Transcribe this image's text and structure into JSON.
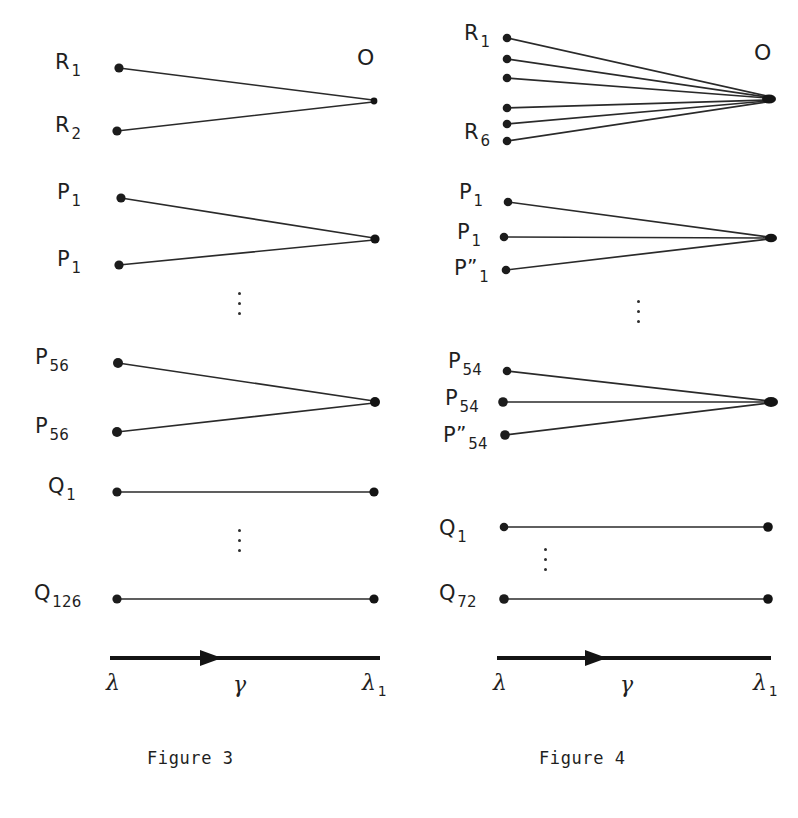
{
  "document": {
    "type": "scientific-figure-plate",
    "background_color": "#ffffff",
    "ink_color": "#1f1f1f"
  },
  "figures": [
    {
      "id": "figure-3",
      "caption": "Figure 3",
      "origin_label": "O",
      "axis": {
        "left_label": {
          "base": "λ",
          "sub": ""
        },
        "mid_label": {
          "base": "γ",
          "sub": ""
        },
        "right_label": {
          "base": "λ",
          "sub": "1"
        },
        "direction": "right"
      },
      "groups": [
        {
          "name": "R-rays",
          "labels": [
            {
              "base": "R",
              "sub": "1",
              "prime": ""
            },
            {
              "base": "R",
              "sub": "2",
              "prime": ""
            }
          ]
        },
        {
          "name": "P-rays-first",
          "labels": [
            {
              "base": "P",
              "sub": "1",
              "prime": ""
            },
            {
              "base": "P",
              "sub": "1",
              "prime": ""
            }
          ]
        },
        {
          "name": "P-rays-last",
          "labels": [
            {
              "base": "P",
              "sub": "56",
              "prime": ""
            },
            {
              "base": "P",
              "sub": "56",
              "prime": ""
            }
          ]
        },
        {
          "name": "Q-lines",
          "labels": [
            {
              "base": "Q",
              "sub": "1",
              "prime": ""
            },
            {
              "base": "Q",
              "sub": "126",
              "prime": ""
            }
          ]
        }
      ]
    },
    {
      "id": "figure-4",
      "caption": "Figure 4",
      "origin_label": "O",
      "axis": {
        "left_label": {
          "base": "λ",
          "sub": ""
        },
        "mid_label": {
          "base": "γ",
          "sub": ""
        },
        "right_label": {
          "base": "λ",
          "sub": "1"
        },
        "direction": "right"
      },
      "groups": [
        {
          "name": "R-rays",
          "labels": [
            {
              "base": "R",
              "sub": "1",
              "prime": ""
            },
            {
              "base": "R",
              "sub": "6",
              "prime": ""
            }
          ]
        },
        {
          "name": "P-rays-first",
          "labels": [
            {
              "base": "P",
              "sub": "1",
              "prime": ""
            },
            {
              "base": "P",
              "sub": "1",
              "prime": ""
            },
            {
              "base": "P",
              "sub": "1",
              "prime": "”"
            }
          ]
        },
        {
          "name": "P-rays-last",
          "labels": [
            {
              "base": "P",
              "sub": "54",
              "prime": ""
            },
            {
              "base": "P",
              "sub": "54",
              "prime": ""
            },
            {
              "base": "P",
              "sub": "54",
              "prime": "”"
            }
          ]
        },
        {
          "name": "Q-lines",
          "labels": [
            {
              "base": "Q",
              "sub": "1",
              "prime": ""
            },
            {
              "base": "Q",
              "sub": "72",
              "prime": ""
            }
          ]
        }
      ]
    }
  ]
}
